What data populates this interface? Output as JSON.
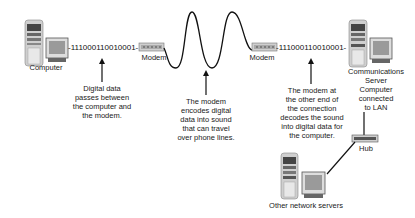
{
  "diagram": {
    "type": "network-flow",
    "nodes": {
      "computer": {
        "label": "Computer"
      },
      "modem_left": {
        "label": "Modem"
      },
      "modem_right": {
        "label": "Modem"
      },
      "server": {
        "label_lines": [
          "Communications",
          "Server",
          "Computer",
          "connected",
          "to LAN"
        ]
      },
      "hub": {
        "label": "Hub"
      },
      "other_servers": {
        "label": "Other network servers"
      }
    },
    "bitstreams": {
      "left": "-111000110010001-",
      "right": "-111000110010001-"
    },
    "annotations": {
      "digital": [
        "Digital data",
        "passes between",
        "the computer and",
        "the modem."
      ],
      "encode": [
        "The modem",
        "encodes digital",
        "data into sound",
        "that can travel",
        "over phone lines."
      ],
      "decode": [
        "The modem at",
        "the other end of",
        "the connection",
        "decodes the sound",
        "into digital data for",
        "the computer."
      ]
    },
    "colors": {
      "line": "#111111",
      "device_body": "#d8d8d8",
      "device_dark": "#555555",
      "screen": "#9a9a9a"
    }
  }
}
